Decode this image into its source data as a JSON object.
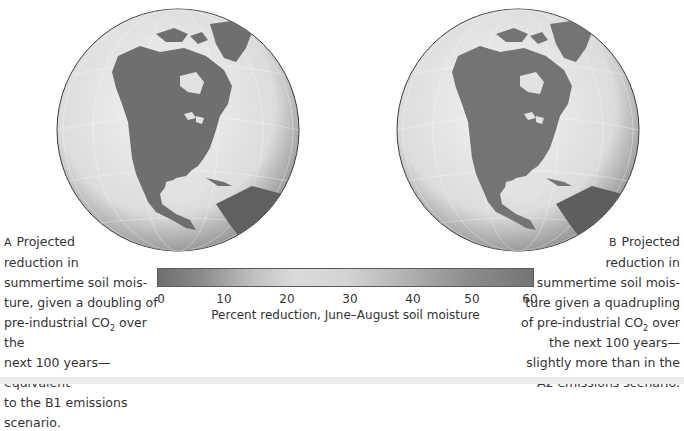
{
  "figure": {
    "panel_a": {
      "marker": "A",
      "caption_lines": [
        "Projected",
        "reduction in",
        "summertime soil mois-",
        "ture, given a doubling of",
        "pre-industrial CO",
        "over the",
        "next 100 years—equivalent",
        "to the B1 emissions",
        "scenario."
      ],
      "co2_subscript": "2"
    },
    "panel_b": {
      "marker": "B",
      "caption_lines": [
        "Projected",
        "reduction in",
        "summertime soil mois-",
        "ture given a quadrupling",
        "of pre-industrial CO",
        "over",
        "the next 100 years—",
        "slightly more than in the",
        "A2 emissions scenario."
      ],
      "co2_subscript": "2"
    },
    "colorbar": {
      "ticks": [
        "0",
        "10",
        "20",
        "30",
        "40",
        "50",
        "60"
      ],
      "label": "Percent reduction, June–August soil moisture",
      "range": [
        0,
        60
      ]
    },
    "colors": {
      "land": "#6f6f6f",
      "ocean": "#e4e4e4",
      "globe_edge": "#3a3a3a",
      "bottom_strip": "#ececec"
    }
  }
}
